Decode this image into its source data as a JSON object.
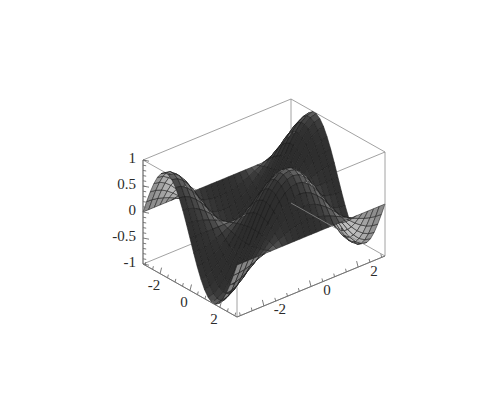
{
  "figure": {
    "kind": "surface-plot-3d",
    "background": "#ffffff",
    "frame_color": "#8a8a8a",
    "axis_color": "#6e6e6e",
    "label_color": "#2b2b2b",
    "mesh_line_color": "#1c1c1c",
    "surface_light_gray": "#c8c8c8",
    "surface_dark_gray": "#232323"
  },
  "chart_data": {
    "type": "surface",
    "title": "",
    "xlabel": "",
    "ylabel": "",
    "zlabel": "",
    "function": "sin(x)*cos(y)",
    "xlim": [
      -3.14159,
      3.14159
    ],
    "ylim": [
      -3.14159,
      3.14159
    ],
    "zlim": [
      -1,
      1
    ],
    "grid": false,
    "legend": "none",
    "x_ticks": [
      -2,
      0,
      2
    ],
    "x_tick_labels": [
      "-2",
      "0",
      "2"
    ],
    "y_ticks": [
      2,
      0,
      -2
    ],
    "y_tick_labels": [
      "2",
      "0",
      "-2"
    ],
    "z_ticks": [
      1,
      0.5,
      0,
      -0.5,
      -1
    ],
    "z_tick_labels": [
      "1",
      "0.5",
      "0",
      "-0.5",
      "-1"
    ],
    "mesh_n": 26,
    "view": {
      "azimuth_deg": 38,
      "elevation_deg": 24,
      "projection": "oblique-parallel"
    }
  },
  "axes": {
    "z_axis": {
      "name": "vertical-axis",
      "ticks": [
        {
          "value": 1,
          "label": "1"
        },
        {
          "value": 0.5,
          "label": "0.5"
        },
        {
          "value": 0,
          "label": "0"
        },
        {
          "value": -0.5,
          "label": "-0.5"
        },
        {
          "value": -1,
          "label": "-1"
        }
      ]
    },
    "x_axis": {
      "name": "front-left-axis",
      "ticks": [
        {
          "value": -2,
          "label": "-2"
        },
        {
          "value": 0,
          "label": "0"
        },
        {
          "value": 2,
          "label": "2"
        }
      ]
    },
    "y_axis": {
      "name": "front-right-axis",
      "ticks": [
        {
          "value": 2,
          "label": "2"
        },
        {
          "value": 0,
          "label": "0"
        },
        {
          "value": -2,
          "label": "-2"
        }
      ]
    }
  }
}
